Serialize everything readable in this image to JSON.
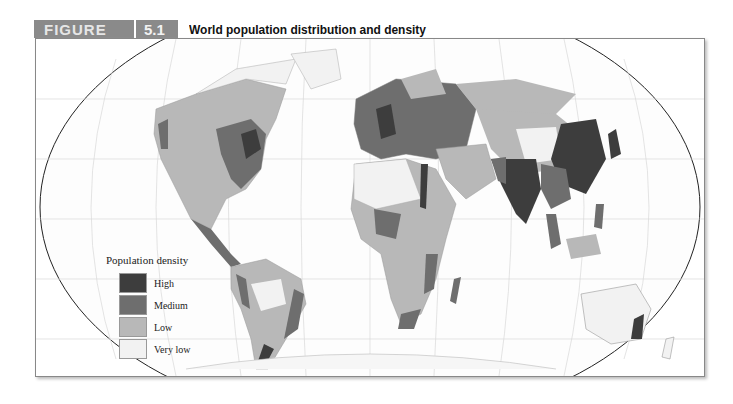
{
  "figure": {
    "label": "FIGURE",
    "number": "5.1",
    "title": "World population distribution and density"
  },
  "legend": {
    "title": "Population density",
    "items": [
      {
        "label": "High",
        "color": "#3d3d3d"
      },
      {
        "label": "Medium",
        "color": "#6e6e6e"
      },
      {
        "label": "Low",
        "color": "#b8b8b8"
      },
      {
        "label": "Very low",
        "color": "#f2f2f2"
      }
    ]
  },
  "colors": {
    "header_bg": "#8a8a8a",
    "ocean": "#ffffff",
    "grid": "#d8d8d8",
    "border": "#888888"
  }
}
